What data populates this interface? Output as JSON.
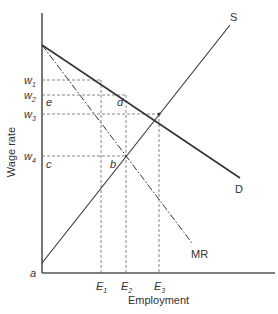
{
  "diagram": {
    "axes": {
      "x_label": "Employment",
      "y_label": "Wage rate"
    },
    "curves": {
      "supply": "S",
      "demand": "D",
      "marginal_revenue": "MR"
    },
    "wage_levels": [
      {
        "main": "w",
        "sub": "1"
      },
      {
        "main": "w",
        "sub": "2"
      },
      {
        "main": "w",
        "sub": "3"
      },
      {
        "main": "w",
        "sub": "4"
      }
    ],
    "employment_levels": [
      {
        "main": "E",
        "sub": "1"
      },
      {
        "main": "E",
        "sub": "2"
      },
      {
        "main": "E",
        "sub": "3"
      }
    ],
    "points": {
      "a": "a",
      "b": "b",
      "c": "c",
      "d": "d",
      "e": "e"
    },
    "colors": {
      "axis": "#555555",
      "curve": "#333333",
      "dashed": "#888888"
    }
  }
}
